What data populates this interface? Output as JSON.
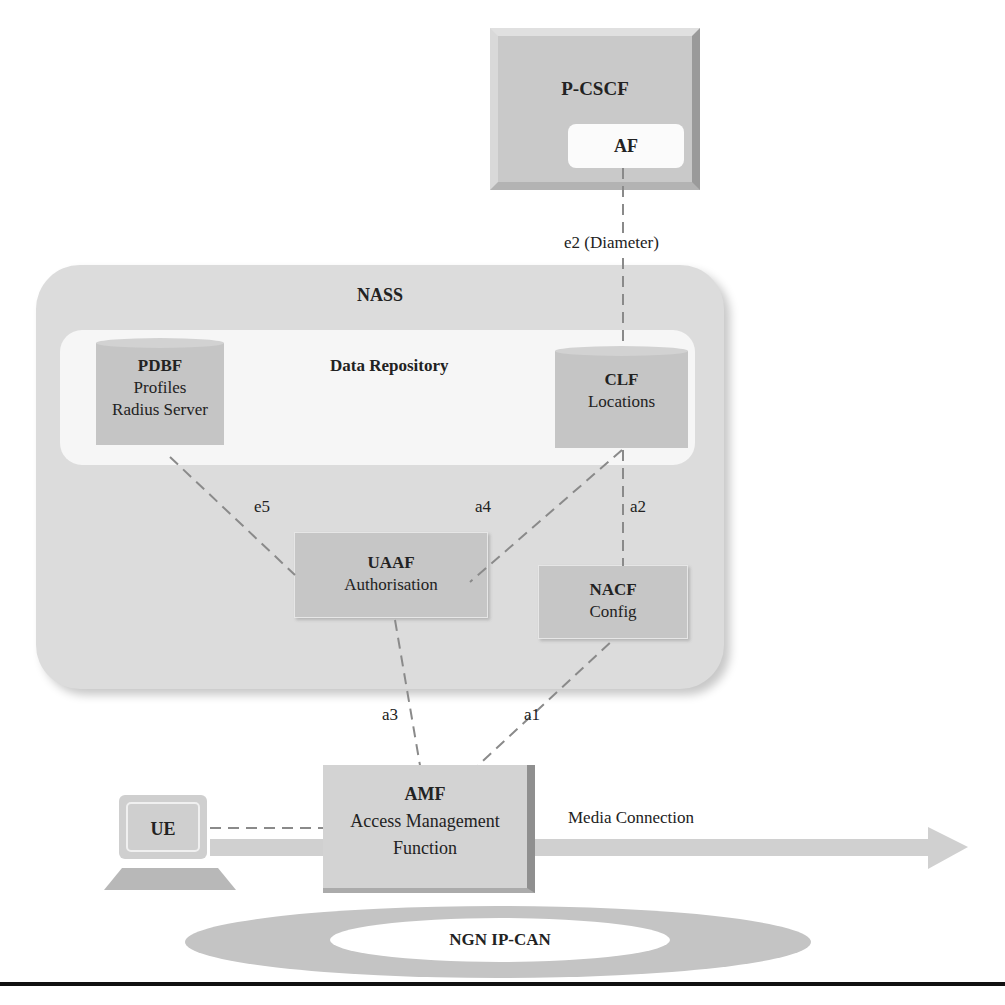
{
  "diagram": {
    "nodes": {
      "pcscf": {
        "title": "P-CSCF",
        "inner": "AF"
      },
      "nass": {
        "title": "NASS"
      },
      "repository": {
        "title": "Data Repository"
      },
      "pdbf": {
        "title": "PDBF",
        "line1": "Profiles",
        "line2": "Radius Server"
      },
      "clf": {
        "title": "CLF",
        "line1": "Locations"
      },
      "uaaf": {
        "title": "UAAF",
        "line1": "Authorisation"
      },
      "nacf": {
        "title": "NACF",
        "line1": "Config"
      },
      "amf": {
        "title": "AMF",
        "line1": "Access Management",
        "line2": "Function"
      },
      "ue": {
        "title": "UE"
      },
      "ipcan": {
        "title": "NGN IP-CAN"
      }
    },
    "interfaces": {
      "e2": "e2 (Diameter)",
      "e5": "e5",
      "a4": "a4",
      "a2": "a2",
      "a3": "a3",
      "a1": "a1"
    },
    "media": {
      "label": "Media Connection"
    },
    "colors": {
      "box_fill": "#c6c6c6",
      "container_fill": "#dcdcdc",
      "repository_fill": "#f6f6f6",
      "dash_line": "#8a8a8a",
      "text": "#1a1a1a"
    }
  }
}
